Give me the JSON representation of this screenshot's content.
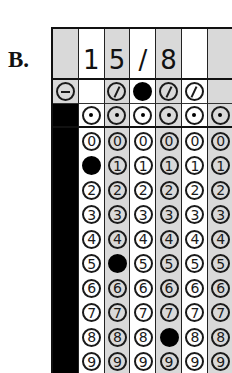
{
  "label": "B.",
  "answer": {
    "columns": [
      {
        "header": "",
        "shade": "gray",
        "symbol": "minus",
        "symbol_filled": false,
        "has_decimal": false,
        "has_digits": false,
        "filled_digit": null
      },
      {
        "header": "1",
        "shade": "white",
        "symbol": null,
        "symbol_filled": false,
        "has_decimal": true,
        "has_digits": true,
        "filled_digit": 1
      },
      {
        "header": "5",
        "shade": "gray",
        "symbol": "slash",
        "symbol_filled": false,
        "has_decimal": true,
        "has_digits": true,
        "filled_digit": 5
      },
      {
        "header": "/",
        "shade": "white",
        "symbol": "slash",
        "symbol_filled": true,
        "has_decimal": true,
        "has_digits": true,
        "filled_digit": null
      },
      {
        "header": "8",
        "shade": "gray",
        "symbol": "slash",
        "symbol_filled": false,
        "has_decimal": true,
        "has_digits": true,
        "filled_digit": 8
      },
      {
        "header": "",
        "shade": "white",
        "symbol": "slash",
        "symbol_filled": false,
        "has_decimal": true,
        "has_digits": true,
        "filled_digit": null
      },
      {
        "header": "",
        "shade": "gray",
        "symbol": null,
        "symbol_filled": false,
        "has_decimal": true,
        "has_digits": true,
        "filled_digit": null
      }
    ],
    "digits": [
      "0",
      "1",
      "2",
      "3",
      "4",
      "5",
      "6",
      "7",
      "8",
      "9"
    ],
    "value": "15/8"
  }
}
